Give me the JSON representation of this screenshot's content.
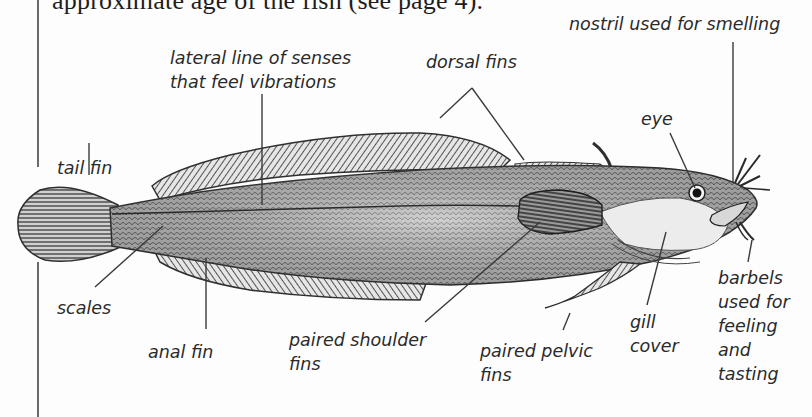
{
  "page": {
    "intro_text": "approximate age of the fish (see page 4)."
  },
  "diagram": {
    "labels": {
      "tail_fin": [
        "tail fin"
      ],
      "lateral_line": [
        "lateral line of senses",
        "that feel vibrations"
      ],
      "dorsal_fins": [
        "dorsal fins"
      ],
      "nostril": [
        "nostril used for smelling"
      ],
      "eye": [
        "eye"
      ],
      "scales": [
        "scales"
      ],
      "anal_fin": [
        "anal fin"
      ],
      "paired_shoulder_fins": [
        "paired shoulder",
        "fins"
      ],
      "paired_pelvic_fins": [
        "paired pelvic",
        "fins"
      ],
      "gill_cover": [
        "gill",
        "cover"
      ],
      "barbels": [
        "barbels",
        "used for",
        "feeling",
        "and",
        "tasting"
      ]
    },
    "colors": {
      "ink": "#2a2a2a",
      "leader_line": "#3a3a3a",
      "fish_body": "#a9a9a9",
      "fin": "#8c8c8c",
      "gill_cover": "#e8e8e8",
      "background": "#fdfdfd"
    }
  }
}
